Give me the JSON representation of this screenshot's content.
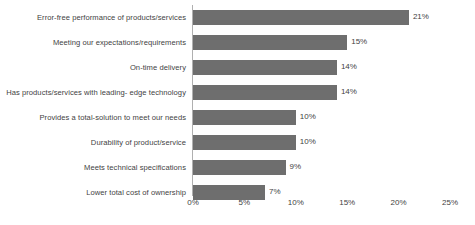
{
  "chart_data": {
    "type": "bar",
    "orientation": "horizontal",
    "title": "",
    "subtitle": "",
    "xlabel": "",
    "ylabel": "",
    "xlim": [
      0,
      25
    ],
    "grid": false,
    "legend": false,
    "legend_position": "none",
    "value_suffix": "%",
    "bar_color": "#6e6e6e",
    "background_color": "#ffffff",
    "text_color": "#3f3f3f",
    "axis_line_color": "#b0b0b0",
    "categories": [
      "Error-free performance of products/services",
      "Meeting our expectations/requirements",
      "On-time delivery",
      "Has products/services with leading- edge technology",
      "Provides a total-solution to meet our needs",
      "Durability of product/service",
      "Meets technical specifications",
      "Lower total cost of ownership"
    ],
    "values": [
      21,
      15,
      14,
      14,
      10,
      10,
      9,
      7
    ],
    "data_labels": [
      "21%",
      "15%",
      "14%",
      "14%",
      "10%",
      "10%",
      "9%",
      "7%"
    ],
    "xticks": [
      0,
      5,
      10,
      15,
      20,
      25
    ],
    "xtick_labels": [
      "0%",
      "5%",
      "10%",
      "15%",
      "20%",
      "25%"
    ]
  }
}
